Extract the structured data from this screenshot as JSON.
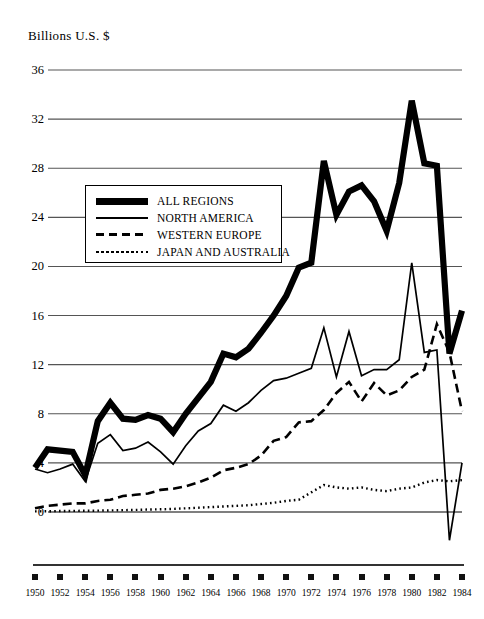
{
  "chart_data": {
    "type": "line",
    "title": "",
    "ylabel": "Billions U.S. $",
    "xlabel": "",
    "ylim": [
      -4,
      36
    ],
    "xlim": [
      1950,
      1984
    ],
    "grid": "horizontal",
    "legend_position": "upper-left-inside",
    "ytick_labels": [
      "36",
      "32",
      "28",
      "24",
      "20",
      "16",
      "12",
      "8",
      "4",
      "0"
    ],
    "ytick_values": [
      36,
      32,
      28,
      24,
      20,
      16,
      12,
      8,
      4,
      0
    ],
    "xtick_labels": [
      "1950",
      "1952",
      "1954",
      "1956",
      "1958",
      "1960",
      "1962",
      "1964",
      "1966",
      "1968",
      "1970",
      "1972",
      "1974",
      "1976",
      "1978",
      "1980",
      "1982",
      "1984"
    ],
    "xtick_values": [
      1950,
      1952,
      1954,
      1956,
      1958,
      1960,
      1962,
      1964,
      1966,
      1968,
      1970,
      1972,
      1974,
      1976,
      1978,
      1980,
      1982,
      1984
    ],
    "x": [
      1950,
      1951,
      1952,
      1953,
      1954,
      1955,
      1956,
      1957,
      1958,
      1959,
      1960,
      1961,
      1962,
      1963,
      1964,
      1965,
      1966,
      1967,
      1968,
      1969,
      1970,
      1971,
      1972,
      1973,
      1974,
      1975,
      1976,
      1977,
      1978,
      1979,
      1980,
      1981,
      1982,
      1983,
      1984
    ],
    "series": [
      {
        "name": "ALL REGIONS",
        "style": "thick-solid",
        "color": "#000000",
        "values": [
          3.6,
          5.1,
          5.0,
          4.9,
          3.0,
          7.4,
          8.9,
          7.6,
          7.5,
          7.9,
          7.6,
          6.5,
          8.0,
          9.3,
          10.6,
          12.9,
          12.6,
          13.3,
          14.6,
          16.0,
          17.6,
          19.9,
          20.3,
          28.6,
          24.2,
          26.1,
          26.6,
          25.3,
          22.9,
          26.8,
          33.5,
          28.4,
          28.2,
          12.9,
          16.4
        ]
      },
      {
        "name": "NORTH AMERICA",
        "style": "thin-solid",
        "color": "#000000",
        "values": [
          3.5,
          3.2,
          3.5,
          3.9,
          2.5,
          5.6,
          6.3,
          5.0,
          5.2,
          5.7,
          4.9,
          3.9,
          5.4,
          6.6,
          7.2,
          8.7,
          8.2,
          8.9,
          9.9,
          10.7,
          10.9,
          11.3,
          11.7,
          15.0,
          11.0,
          14.7,
          11.1,
          11.6,
          11.6,
          12.4,
          20.3,
          13.0,
          13.2,
          -2.3,
          4.0
        ]
      },
      {
        "name": "WESTERN EUROPE",
        "style": "dashed",
        "color": "#000000",
        "values": [
          0.3,
          0.5,
          0.6,
          0.7,
          0.7,
          0.9,
          1.0,
          1.3,
          1.4,
          1.5,
          1.8,
          1.9,
          2.1,
          2.4,
          2.8,
          3.4,
          3.6,
          3.9,
          4.6,
          5.8,
          6.1,
          7.3,
          7.4,
          8.3,
          9.7,
          10.6,
          9.0,
          10.5,
          9.5,
          9.9,
          11.0,
          11.6,
          15.3,
          13.0,
          8.2
        ]
      },
      {
        "name": "JAPAN AND AUSTRALIA",
        "style": "dotted",
        "color": "#000000",
        "values": [
          0.05,
          0.06,
          0.08,
          0.09,
          0.1,
          0.11,
          0.13,
          0.15,
          0.17,
          0.2,
          0.22,
          0.25,
          0.3,
          0.35,
          0.4,
          0.45,
          0.5,
          0.55,
          0.65,
          0.75,
          0.9,
          1.0,
          1.6,
          2.2,
          2.0,
          1.9,
          2.0,
          1.8,
          1.7,
          1.9,
          2.0,
          2.4,
          2.6,
          2.5,
          2.6
        ]
      }
    ]
  },
  "legend": {
    "items": [
      {
        "label": "ALL REGIONS",
        "swatch": "thick-solid"
      },
      {
        "label": "NORTH AMERICA",
        "swatch": "thin-solid"
      },
      {
        "label": "WESTERN EUROPE",
        "swatch": "dashed"
      },
      {
        "label": "JAPAN AND AUSTRALIA",
        "swatch": "dotted"
      }
    ]
  }
}
